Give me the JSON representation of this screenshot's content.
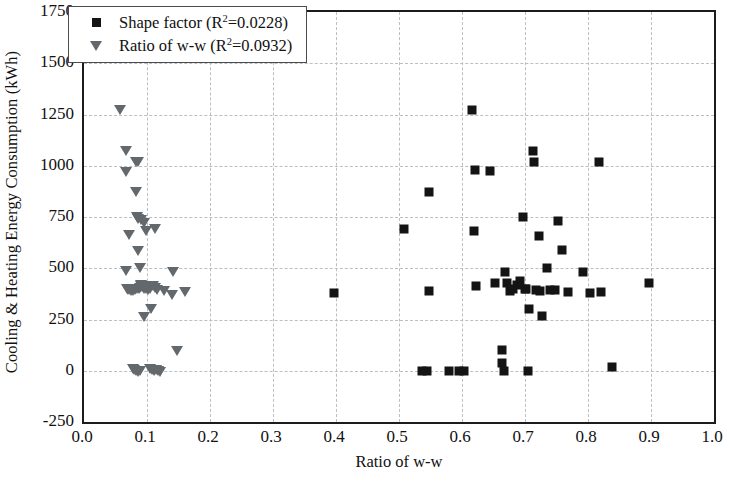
{
  "chart_data": {
    "type": "scatter",
    "title": "",
    "xlabel": "Ratio of w-w",
    "ylabel": "Cooling & Heating Energy Consumption (kWh)",
    "xlim": [
      0.0,
      1.0
    ],
    "ylim": [
      -250,
      1750
    ],
    "xticks": [
      "0.0",
      "0.1",
      "0.2",
      "0.3",
      "0.4",
      "0.5",
      "0.6",
      "0.7",
      "0.8",
      "0.9",
      "1.0"
    ],
    "xtick_values": [
      0.0,
      0.1,
      0.2,
      0.3,
      0.4,
      0.5,
      0.6,
      0.7,
      0.8,
      0.9,
      1.0
    ],
    "yticks": [
      "-250",
      "0",
      "250",
      "500",
      "750",
      "1000",
      "1250",
      "1500",
      "1750"
    ],
    "ytick_values": [
      -250,
      0,
      250,
      500,
      750,
      1000,
      1250,
      1500,
      1750
    ],
    "grid": true,
    "legend_position": "top-left",
    "series": [
      {
        "name": "Shape factor",
        "r_squared": "0.0228",
        "legend_label_prefix": "Shape factor (R",
        "legend_label_suffix": "=0.0228)",
        "marker": "square",
        "color": "#141414",
        "points": [
          [
            0.397,
            380
          ],
          [
            0.508,
            690
          ],
          [
            0.537,
            0
          ],
          [
            0.545,
            0
          ],
          [
            0.548,
            390
          ],
          [
            0.579,
            0
          ],
          [
            0.596,
            0
          ],
          [
            0.603,
            0
          ],
          [
            0.616,
            1270
          ],
          [
            0.619,
            680
          ],
          [
            0.621,
            980
          ],
          [
            0.547,
            870
          ],
          [
            0.622,
            415
          ],
          [
            0.645,
            975
          ],
          [
            0.652,
            430
          ],
          [
            0.663,
            100
          ],
          [
            0.664,
            40
          ],
          [
            0.667,
            0
          ],
          [
            0.668,
            480
          ],
          [
            0.672,
            430
          ],
          [
            0.676,
            390
          ],
          [
            0.681,
            400
          ],
          [
            0.688,
            420
          ],
          [
            0.692,
            440
          ],
          [
            0.697,
            750
          ],
          [
            0.7,
            400
          ],
          [
            0.702,
            400
          ],
          [
            0.705,
            0
          ],
          [
            0.707,
            300
          ],
          [
            0.712,
            1070
          ],
          [
            0.714,
            1020
          ],
          [
            0.718,
            395
          ],
          [
            0.722,
            655
          ],
          [
            0.724,
            390
          ],
          [
            0.727,
            265
          ],
          [
            0.735,
            500
          ],
          [
            0.74,
            395
          ],
          [
            0.748,
            395
          ],
          [
            0.752,
            730
          ],
          [
            0.758,
            590
          ],
          [
            0.768,
            385
          ],
          [
            0.792,
            480
          ],
          [
            0.803,
            380
          ],
          [
            0.818,
            1020
          ],
          [
            0.82,
            382
          ],
          [
            0.838,
            20
          ],
          [
            0.897,
            430
          ]
        ]
      },
      {
        "name": "Ratio of w-w",
        "r_squared": "0.0932",
        "legend_label_prefix": "Ratio of w-w (R",
        "legend_label_suffix": "=0.0932)",
        "marker": "triangle",
        "color": "#63686c",
        "points": [
          [
            0.057,
            1270
          ],
          [
            0.066,
            1070
          ],
          [
            0.067,
            970
          ],
          [
            0.082,
            1020
          ],
          [
            0.086,
            1020
          ],
          [
            0.083,
            870
          ],
          [
            0.071,
            660
          ],
          [
            0.084,
            750
          ],
          [
            0.086,
            740
          ],
          [
            0.09,
            735
          ],
          [
            0.095,
            720
          ],
          [
            0.098,
            680
          ],
          [
            0.112,
            690
          ],
          [
            0.086,
            585
          ],
          [
            0.066,
            485
          ],
          [
            0.089,
            500
          ],
          [
            0.09,
            420
          ],
          [
            0.092,
            410
          ],
          [
            0.068,
            400
          ],
          [
            0.07,
            395
          ],
          [
            0.073,
            392
          ],
          [
            0.075,
            390
          ],
          [
            0.078,
            388
          ],
          [
            0.081,
            392
          ],
          [
            0.084,
            398
          ],
          [
            0.087,
            400
          ],
          [
            0.089,
            405
          ],
          [
            0.091,
            412
          ],
          [
            0.093,
            408
          ],
          [
            0.096,
            400
          ],
          [
            0.098,
            398
          ],
          [
            0.101,
            395
          ],
          [
            0.104,
            400
          ],
          [
            0.107,
            412
          ],
          [
            0.11,
            415
          ],
          [
            0.113,
            405
          ],
          [
            0.116,
            395
          ],
          [
            0.127,
            390
          ],
          [
            0.141,
            480
          ],
          [
            0.14,
            370
          ],
          [
            0.16,
            385
          ],
          [
            0.095,
            260
          ],
          [
            0.107,
            300
          ],
          [
            0.148,
            95
          ],
          [
            0.078,
            10
          ],
          [
            0.08,
            5
          ],
          [
            0.083,
            0
          ],
          [
            0.086,
            -5
          ],
          [
            0.089,
            0
          ],
          [
            0.105,
            10
          ],
          [
            0.108,
            5
          ],
          [
            0.111,
            0
          ],
          [
            0.114,
            5
          ],
          [
            0.117,
            0
          ],
          [
            0.12,
            -5
          ]
        ]
      }
    ]
  }
}
